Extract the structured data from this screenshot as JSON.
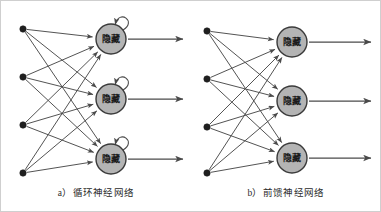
{
  "figure": {
    "width": 381,
    "height": 212,
    "background": "#ffffff",
    "frame_color": "#cfcfcf"
  },
  "style": {
    "hidden_node_fill": "#b4b4b4",
    "hidden_node_stroke": "#3a3a3a",
    "input_node_fill": "#1f1f1f",
    "edge_color": "#4a4a4a",
    "arrow_color": "#4a4a4a",
    "caption_color": "#2b2b2b",
    "hidden_node_radius": 15,
    "input_node_radius": 3.2
  },
  "panels": [
    {
      "id": "rnn",
      "caption": "a）循环神经网络",
      "has_self_loops": true,
      "input_nodes": [
        {
          "id": "in1",
          "cx": 22,
          "cy": 28
        },
        {
          "id": "in2",
          "cx": 22,
          "cy": 76
        },
        {
          "id": "in3",
          "cx": 22,
          "cy": 124
        },
        {
          "id": "in4",
          "cx": 22,
          "cy": 172
        }
      ],
      "hidden_nodes": [
        {
          "id": "h1",
          "cx": 110,
          "cy": 38,
          "label": "隐藏"
        },
        {
          "id": "h2",
          "cx": 110,
          "cy": 98,
          "label": "隐藏"
        },
        {
          "id": "h3",
          "cx": 110,
          "cy": 158,
          "label": "隐藏"
        }
      ],
      "output_arrows": [
        {
          "from_node": "h1",
          "x1": 125,
          "y1": 38,
          "x2": 182,
          "y2": 38
        },
        {
          "from_node": "h2",
          "x1": 125,
          "y1": 98,
          "x2": 182,
          "y2": 98
        },
        {
          "from_node": "h3",
          "x1": 125,
          "y1": 158,
          "x2": 182,
          "y2": 158
        }
      ]
    },
    {
      "id": "ffn",
      "caption": "b）前馈神经网络",
      "has_self_loops": false,
      "input_nodes": [
        {
          "id": "in1",
          "cx": 16,
          "cy": 30
        },
        {
          "id": "in2",
          "cx": 16,
          "cy": 78
        },
        {
          "id": "in3",
          "cx": 16,
          "cy": 126
        },
        {
          "id": "in4",
          "cx": 16,
          "cy": 172
        }
      ],
      "hidden_nodes": [
        {
          "id": "h1",
          "cx": 101,
          "cy": 41,
          "label": "隐藏"
        },
        {
          "id": "h2",
          "cx": 101,
          "cy": 100,
          "label": "隐藏"
        },
        {
          "id": "h3",
          "cx": 101,
          "cy": 157,
          "label": "隐藏"
        }
      ],
      "output_arrows": [
        {
          "from_node": "h1",
          "x1": 116,
          "y1": 41,
          "x2": 180,
          "y2": 41
        },
        {
          "from_node": "h2",
          "x1": 116,
          "y1": 100,
          "x2": 180,
          "y2": 100
        },
        {
          "from_node": "h3",
          "x1": 116,
          "y1": 157,
          "x2": 180,
          "y2": 157
        }
      ]
    }
  ]
}
